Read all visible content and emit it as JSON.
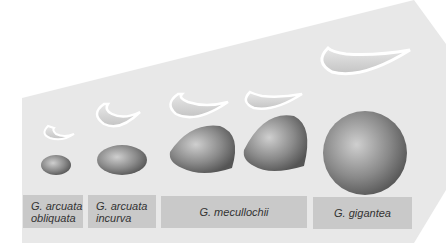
{
  "figure": {
    "colors": {
      "arrow_fill": "#e6e6e6",
      "label_fill": "#c9c9c9",
      "shell_dark": "#6e6e6e",
      "shell_light": "#d8d8d8"
    },
    "species": [
      {
        "line1": "G. arcuata",
        "line2": "obliquata"
      },
      {
        "line1": "G. arcuata",
        "line2": "incurva"
      },
      {
        "line1": "G. mecullochii",
        "line2": ""
      },
      {
        "line1": "G. gigantea",
        "line2": ""
      }
    ]
  }
}
